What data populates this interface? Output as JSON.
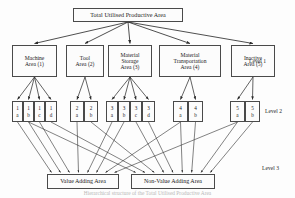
{
  "diagram": {
    "title": "Total Utilised Productive Area",
    "type": "hierarchy-tree",
    "levels": [
      {
        "id": "level1",
        "label": "Level 1"
      },
      {
        "id": "level2",
        "label": "Level 2"
      },
      {
        "id": "level3",
        "label": "Level 3"
      }
    ],
    "root": {
      "id": "root",
      "label": "Total Utilised Productive Area",
      "x": 73,
      "y": 8,
      "w": 110,
      "h": 14
    },
    "level1_nodes": [
      {
        "id": "area1",
        "line1": "Machine",
        "line2": "Area (1)",
        "line3": "",
        "x": 12,
        "y": 45,
        "w": 45,
        "h": 32
      },
      {
        "id": "area2",
        "line1": "Tool",
        "line2": "Area (2)",
        "line3": "",
        "x": 66,
        "y": 45,
        "w": 38,
        "h": 32
      },
      {
        "id": "area3",
        "line1": "Material",
        "line2": "Storage",
        "line3": "Area (3)",
        "x": 108,
        "y": 45,
        "w": 44,
        "h": 32
      },
      {
        "id": "area4",
        "line1": "Material",
        "line2": "Transportation",
        "line3": "Area (4)",
        "x": 159,
        "y": 45,
        "w": 62,
        "h": 32
      },
      {
        "id": "area5",
        "line1": "Inactive",
        "line2": "Area (5)",
        "line3": "",
        "x": 231,
        "y": 45,
        "w": 44,
        "h": 32
      }
    ],
    "level2_nodes": [
      {
        "id": "n1a",
        "top": "1",
        "bot": "a",
        "x": 12,
        "y": 101,
        "w": 11,
        "h": 21,
        "parent": "area1"
      },
      {
        "id": "n1b",
        "top": "1",
        "bot": "b",
        "x": 23,
        "y": 101,
        "w": 11,
        "h": 21,
        "parent": "area1"
      },
      {
        "id": "n1c",
        "top": "1",
        "bot": "c",
        "x": 34,
        "y": 101,
        "w": 11,
        "h": 21,
        "parent": "area1"
      },
      {
        "id": "n1d",
        "top": "1",
        "bot": "d",
        "x": 45,
        "y": 101,
        "w": 12,
        "h": 21,
        "parent": "area1"
      },
      {
        "id": "n2a",
        "top": "2",
        "bot": "a",
        "x": 70,
        "y": 101,
        "w": 14,
        "h": 21,
        "parent": "area2"
      },
      {
        "id": "n2b",
        "top": "2",
        "bot": "b",
        "x": 84,
        "y": 101,
        "w": 14,
        "h": 21,
        "parent": "area2"
      },
      {
        "id": "n3a",
        "top": "3",
        "bot": "a",
        "x": 106,
        "y": 101,
        "w": 12,
        "h": 21,
        "parent": "area3"
      },
      {
        "id": "n3b",
        "top": "3",
        "bot": "b",
        "x": 118,
        "y": 101,
        "w": 12,
        "h": 21,
        "parent": "area3"
      },
      {
        "id": "n3c",
        "top": "3",
        "bot": "c",
        "x": 130,
        "y": 101,
        "w": 12,
        "h": 21,
        "parent": "area3"
      },
      {
        "id": "n3d",
        "top": "3",
        "bot": "d",
        "x": 142,
        "y": 101,
        "w": 13,
        "h": 21,
        "parent": "area3"
      },
      {
        "id": "n4a",
        "top": "4",
        "bot": "a",
        "x": 173,
        "y": 101,
        "w": 15,
        "h": 21,
        "parent": "area4"
      },
      {
        "id": "n4b",
        "top": "4",
        "bot": "b",
        "x": 188,
        "y": 101,
        "w": 15,
        "h": 21,
        "parent": "area4"
      },
      {
        "id": "n5a",
        "top": "5",
        "bot": "a",
        "x": 230,
        "y": 101,
        "w": 15,
        "h": 21,
        "parent": "area5"
      },
      {
        "id": "n5b",
        "top": "5",
        "bot": "b",
        "x": 245,
        "y": 101,
        "w": 15,
        "h": 21,
        "parent": "area5"
      }
    ],
    "level3_nodes": [
      {
        "id": "vaa",
        "label": "Value Adding Area",
        "x": 47,
        "y": 174,
        "w": 72,
        "h": 15
      },
      {
        "id": "nvaa",
        "label": "Non-Value Adding Area",
        "x": 131,
        "y": 174,
        "w": 84,
        "h": 15
      }
    ],
    "level3_targets_vaa": [
      "n1a",
      "n1b",
      "n1c",
      "n2a",
      "n3a",
      "n3b",
      "n4a",
      "n5a"
    ],
    "level3_targets_nvaa": [
      "n1b",
      "n1d",
      "n2b",
      "n3c",
      "n3d",
      "n4a",
      "n4b",
      "n5a",
      "n5b"
    ],
    "level_label_positions": [
      {
        "label": "Level 1",
        "x": 249,
        "y": 58
      },
      {
        "label": "Level 2",
        "x": 265,
        "y": 108
      },
      {
        "label": "Level 3",
        "x": 262,
        "y": 165
      }
    ],
    "caption": "Hierarchical structure of the Total Utilised Productive Area",
    "colors": {
      "stroke": "#3a3a3a",
      "box_border": "#4a4a4a",
      "box_fill": "#fcfcfc",
      "text": "#1a1a1a",
      "background": "#fdfdfd"
    }
  }
}
